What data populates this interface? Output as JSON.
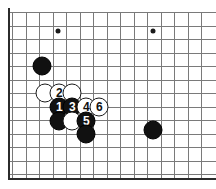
{
  "diagram": {
    "board": {
      "background_color": "#ffffff",
      "line_color": "#7a7a7a",
      "edge_color": "#2b2b2b",
      "grid_spacing_px": 13.5,
      "origin_x_px": 12,
      "origin_y_px": 12,
      "columns_visible": 15,
      "rows_visible": 13,
      "left_edge_is_board_border": true,
      "bottom_edge_is_board_border": true,
      "right_edge_is_board_border": false,
      "top_edge_is_board_border": false
    },
    "star_points": [
      {
        "name": "star-point-left",
        "x": 58,
        "y": 31
      },
      {
        "name": "star-point-right",
        "x": 153,
        "y": 31
      }
    ],
    "stones": [
      {
        "id": "black-upper-left",
        "color": "black",
        "label": "",
        "x": 42,
        "y": 66
      },
      {
        "id": "white-left",
        "color": "white",
        "label": "",
        "x": 45,
        "y": 93
      },
      {
        "id": "white-move-2",
        "color": "white",
        "label": "2",
        "x": 59,
        "y": 93
      },
      {
        "id": "white-right-top",
        "color": "white",
        "label": "",
        "x": 72,
        "y": 93
      },
      {
        "id": "black-move-1",
        "color": "black",
        "label": "1",
        "x": 59,
        "y": 107
      },
      {
        "id": "black-move-3",
        "color": "black",
        "label": "3",
        "x": 72,
        "y": 107
      },
      {
        "id": "white-move-4",
        "color": "white",
        "label": "4",
        "x": 86,
        "y": 107
      },
      {
        "id": "white-move-6",
        "color": "white",
        "label": "6",
        "x": 99,
        "y": 107
      },
      {
        "id": "black-lower-left",
        "color": "black",
        "label": "",
        "x": 59,
        "y": 121
      },
      {
        "id": "white-lower-mid",
        "color": "white",
        "label": "",
        "x": 72,
        "y": 121
      },
      {
        "id": "black-move-5",
        "color": "black",
        "label": "5",
        "x": 86,
        "y": 121
      },
      {
        "id": "black-bottom",
        "color": "black",
        "label": "",
        "x": 86,
        "y": 134
      },
      {
        "id": "black-right",
        "color": "black",
        "label": "",
        "x": 153,
        "y": 130
      }
    ],
    "move_sequence": [
      {
        "number": "1",
        "color": "black"
      },
      {
        "number": "2",
        "color": "white"
      },
      {
        "number": "3",
        "color": "black"
      },
      {
        "number": "4",
        "color": "white"
      },
      {
        "number": "5",
        "color": "black"
      },
      {
        "number": "6",
        "color": "white"
      }
    ]
  }
}
